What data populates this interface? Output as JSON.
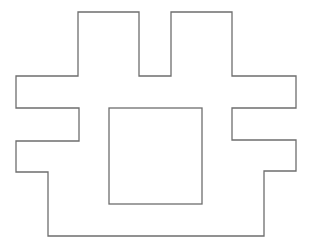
{
  "diagram": {
    "background": "#ffffff",
    "stroke_color": "#6e6e6e",
    "stroke_width": 1.3,
    "outer_shape": {
      "name": "castle-outline",
      "points": "78,12 139,12 139,76 171,76 171,12 232,12 232,76 296,76 296,108 232,108 232,140 296,140 296,171 264,171 264,236 48,236 48,172 16,172 16,141 79,141 79,108 16,108 16,76 78,76"
    },
    "inner_shape": {
      "name": "inner-square",
      "x": 109,
      "y": 108,
      "width": 93,
      "height": 96
    }
  }
}
